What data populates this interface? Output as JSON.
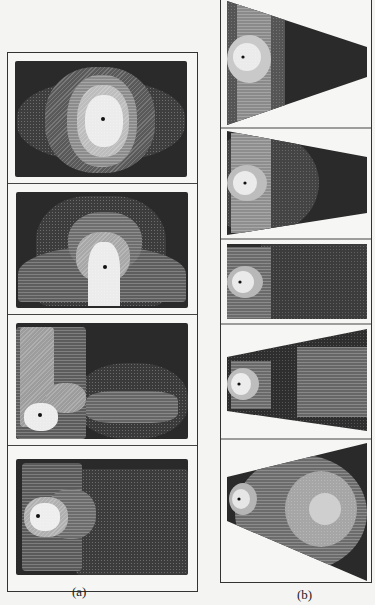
{
  "figure": {
    "panel_a": {
      "caption": "(a)",
      "subplots": [
        {
          "id": "a1",
          "shape": "rectangle",
          "source_position": "center"
        },
        {
          "id": "a2",
          "shape": "rectangle",
          "source_position": "center-lower"
        },
        {
          "id": "a3",
          "shape": "rectangle",
          "source_position": "lower-left"
        },
        {
          "id": "a4",
          "shape": "rectangle",
          "source_position": "left"
        }
      ]
    },
    "panel_b": {
      "caption": "(b)",
      "subplots": [
        {
          "id": "b1",
          "shape": "trapezoid-narrowing-right",
          "source_position": "left"
        },
        {
          "id": "b2",
          "shape": "trapezoid-narrowing-right",
          "source_position": "left"
        },
        {
          "id": "b3",
          "shape": "rectangle",
          "source_position": "left"
        },
        {
          "id": "b4",
          "shape": "trapezoid-widening-right",
          "source_position": "left"
        },
        {
          "id": "b5",
          "shape": "triangle-widening-right",
          "source_position": "left"
        }
      ]
    },
    "colors": {
      "background": "#f4f4f2",
      "plot_dark": "#2a2a2a",
      "level_1": "#4a4a4a",
      "level_2": "#777777",
      "level_3": "#aaaaaa",
      "level_4": "#e8e8e8",
      "frame": "#333333"
    }
  }
}
